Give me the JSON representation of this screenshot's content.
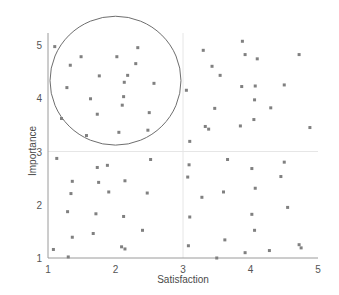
{
  "chart_data": {
    "type": "scatter",
    "title": "",
    "xlabel": "Satisfaction",
    "ylabel": "Importance",
    "xlim": [
      1,
      5
    ],
    "ylim": [
      1,
      5
    ],
    "xticks": [
      1,
      2,
      3,
      4,
      5
    ],
    "yticks": [
      1,
      2,
      3,
      4,
      5
    ],
    "xtick_labels": [
      "1",
      "2",
      "3",
      "4",
      "5"
    ],
    "ytick_labels": [
      "1",
      "2",
      "3",
      "4",
      "5"
    ],
    "grid": true,
    "gridlines": {
      "vertical": [
        3
      ],
      "horizontal": [
        3
      ],
      "color": "#e6e6e6"
    },
    "legend": null,
    "marker": {
      "shape": "square",
      "size_px": 3,
      "color": "#808080"
    },
    "axis_color": "#9a9a9a",
    "annotations": [
      {
        "type": "ellipse",
        "name": "highlight-circle",
        "center": [
          2.0,
          4.33
        ],
        "radius_x": 0.97,
        "radius_y": 1.21,
        "stroke": "#6e6e6e",
        "fill": "none"
      }
    ],
    "points": [
      [
        1.1,
        4.97
      ],
      [
        1.33,
        4.62
      ],
      [
        1.49,
        4.78
      ],
      [
        1.28,
        4.2
      ],
      [
        1.2,
        3.62
      ],
      [
        2.02,
        4.78
      ],
      [
        2.18,
        4.43
      ],
      [
        2.3,
        4.65
      ],
      [
        2.33,
        4.95
      ],
      [
        1.76,
        4.42
      ],
      [
        2.13,
        4.3
      ],
      [
        2.57,
        4.28
      ],
      [
        1.63,
        3.99
      ],
      [
        2.12,
        4.03
      ],
      [
        2.1,
        3.87
      ],
      [
        1.73,
        3.7
      ],
      [
        2.5,
        3.73
      ],
      [
        1.57,
        3.3
      ],
      [
        2.05,
        3.36
      ],
      [
        2.48,
        3.4
      ],
      [
        1.13,
        2.87
      ],
      [
        2.52,
        2.85
      ],
      [
        1.73,
        2.7
      ],
      [
        1.88,
        2.74
      ],
      [
        1.36,
        2.44
      ],
      [
        1.75,
        2.42
      ],
      [
        2.14,
        2.45
      ],
      [
        1.34,
        2.21
      ],
      [
        1.9,
        2.24
      ],
      [
        2.47,
        2.22
      ],
      [
        1.29,
        1.87
      ],
      [
        1.71,
        1.83
      ],
      [
        2.12,
        1.78
      ],
      [
        1.36,
        1.39
      ],
      [
        1.67,
        1.46
      ],
      [
        2.4,
        1.52
      ],
      [
        2.14,
        1.17
      ],
      [
        2.09,
        1.21
      ],
      [
        1.08,
        1.16
      ],
      [
        1.3,
        1.02
      ],
      [
        3.05,
        4.15
      ],
      [
        3.3,
        4.9
      ],
      [
        3.43,
        4.6
      ],
      [
        3.55,
        4.43
      ],
      [
        3.88,
        5.07
      ],
      [
        3.92,
        4.82
      ],
      [
        4.1,
        4.74
      ],
      [
        4.5,
        4.25
      ],
      [
        4.72,
        4.82
      ],
      [
        3.87,
        4.22
      ],
      [
        4.07,
        4.23
      ],
      [
        3.47,
        3.81
      ],
      [
        4.06,
        3.97
      ],
      [
        4.3,
        3.82
      ],
      [
        3.33,
        3.47
      ],
      [
        3.38,
        3.42
      ],
      [
        3.85,
        3.48
      ],
      [
        4.05,
        3.6
      ],
      [
        4.88,
        3.45
      ],
      [
        3.1,
        3.19
      ],
      [
        3.09,
        2.75
      ],
      [
        3.66,
        2.85
      ],
      [
        4.5,
        2.8
      ],
      [
        3.07,
        2.52
      ],
      [
        4.02,
        2.68
      ],
      [
        4.45,
        2.53
      ],
      [
        3.28,
        2.14
      ],
      [
        3.6,
        2.24
      ],
      [
        4.07,
        2.31
      ],
      [
        4.55,
        1.95
      ],
      [
        3.1,
        1.77
      ],
      [
        4.02,
        1.82
      ],
      [
        4.06,
        1.52
      ],
      [
        4.72,
        1.25
      ],
      [
        3.08,
        1.23
      ],
      [
        3.92,
        1.1
      ],
      [
        4.28,
        1.14
      ],
      [
        3.5,
        1.0
      ],
      [
        4.75,
        1.19
      ],
      [
        3.62,
        1.34
      ]
    ]
  },
  "axes": {
    "plot_left_px": 48,
    "plot_right_px": 318,
    "plot_bottom_px": 258,
    "plot_top_px": 45
  }
}
